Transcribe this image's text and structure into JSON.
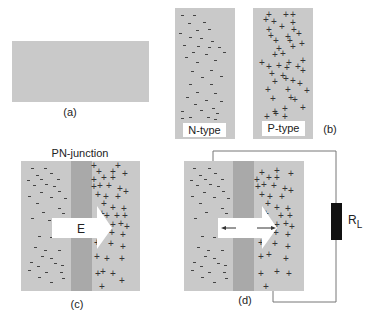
{
  "colors": {
    "background": "#ffffff",
    "semiconductor": "#c9c9c9",
    "depletion": "#a9a9a9",
    "carrier": "#333333",
    "arrow": "#ffffff",
    "wire": "#777777",
    "resistor": "#111111"
  },
  "panel_a": {
    "caption": "(a)"
  },
  "panel_b": {
    "caption": "(b)",
    "n_type_label": "N-type",
    "p_type_label": "P-type"
  },
  "panel_c": {
    "title": "PN-junction",
    "caption": "(c)",
    "field_label": "E"
  },
  "panel_d": {
    "caption": "(d)",
    "load_label": "R",
    "load_subscript": "L"
  }
}
